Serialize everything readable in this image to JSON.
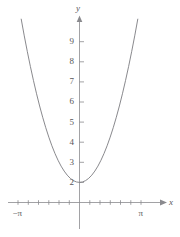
{
  "chart_data": {
    "type": "line",
    "title": "",
    "subtitle": "",
    "xlabel": "x",
    "ylabel": "y",
    "function_label": "y = x² + 1",
    "grid": false,
    "legend": null,
    "xlim": [
      -3.6,
      3.9
    ],
    "ylim": [
      -0.45,
      9.7
    ],
    "x_tick_labels": [
      "−π",
      "π"
    ],
    "x_tick_values": [
      -3.141592653589793,
      3.141592653589793
    ],
    "x_minor_tick_values": [
      -3.141592653589793,
      -2.6179938779914944,
      -2.0943951023931953,
      -1.5707963267948966,
      -1.0471975511965976,
      -0.5235987755982988,
      0.5235987755982988,
      1.0471975511965976,
      1.5707963267948966,
      2.0943951023931953,
      2.6179938779914944,
      3.141592653589793
    ],
    "y_tick_labels": [
      "2",
      "3",
      "4",
      "5",
      "6",
      "7",
      "8",
      "9"
    ],
    "y_tick_values": [
      2,
      3,
      4,
      5,
      6,
      7,
      8,
      9
    ],
    "series": [
      {
        "name": "parabola",
        "color": "#7c7c80",
        "x": [
          -2.85,
          -2.7,
          -2.55,
          -2.4,
          -2.25,
          -2.1,
          -1.95,
          -1.8,
          -1.65,
          -1.5,
          -1.35,
          -1.2,
          -1.05,
          -0.9,
          -0.75,
          -0.6,
          -0.45,
          -0.3,
          -0.15,
          0,
          0.15,
          0.3,
          0.45,
          0.6,
          0.75,
          0.9,
          1.05,
          1.2,
          1.35,
          1.5,
          1.65,
          1.8,
          1.95,
          2.1,
          2.25,
          2.4,
          2.55,
          2.7,
          2.85
        ],
        "y": [
          9.1225,
          8.29,
          7.5025,
          6.76,
          6.0625,
          5.41,
          4.8025,
          4.24,
          3.7225,
          3.25,
          2.8225,
          2.44,
          2.1025,
          1.81,
          1.5625,
          1.36,
          1.2025,
          1.09,
          1.0225,
          1,
          1.0225,
          1.09,
          1.2025,
          1.36,
          1.5625,
          1.81,
          2.1025,
          2.44,
          2.8225,
          3.25,
          3.7225,
          4.24,
          4.8025,
          5.41,
          6.0625,
          6.76,
          7.5025,
          8.29,
          9.1225
        ]
      }
    ],
    "axis_color": "#8a8a8e",
    "curve_color": "#7c7c80",
    "text_color": "#58585a",
    "background": "#ffffff",
    "vertex": [
      0,
      1
    ]
  }
}
